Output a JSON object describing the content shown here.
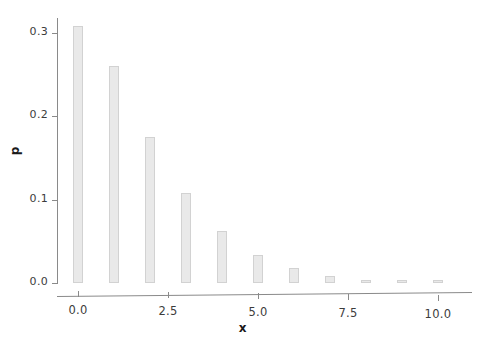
{
  "chart_data": {
    "type": "bar",
    "title": "",
    "subtitle": "",
    "xlabel": "x",
    "ylabel": "p",
    "categories": [
      0,
      1,
      2,
      3,
      4,
      5,
      6,
      7,
      8,
      9,
      10
    ],
    "values": [
      0.308,
      0.261,
      0.175,
      0.108,
      0.062,
      0.034,
      0.018,
      0.009,
      0.004,
      0.0015,
      0.0006
    ],
    "series": [
      {
        "name": "p",
        "values": [
          0.308,
          0.261,
          0.175,
          0.108,
          0.062,
          0.034,
          0.018,
          0.009,
          0.004,
          0.0015,
          0.0006
        ]
      }
    ],
    "xlim": [
      -0.6,
      10.8
    ],
    "ylim": [
      0.0,
      0.32
    ],
    "xticks": [
      0.0,
      2.5,
      5.0,
      7.5,
      10.0
    ],
    "xtick_labels": [
      "0.0",
      "2.5",
      "5.0",
      "7.5",
      "10.0"
    ],
    "yticks": [
      0.0,
      0.1,
      0.2,
      0.3
    ],
    "ytick_labels": [
      "0.0",
      "0.1",
      "0.2",
      "0.3"
    ],
    "grid": false,
    "legend": false,
    "legend_position": "none",
    "bar_color": "#e9e9e9",
    "bar_edge_color": "#d2d2d2",
    "axis_color": "#8a8a8a",
    "text_color": "#3c3c3c",
    "background_color": "#ffffff",
    "annotations": []
  }
}
